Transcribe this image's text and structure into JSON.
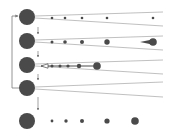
{
  "diagram": {
    "colors": {
      "node": "#4a4a4a",
      "line": "#b0b0b0",
      "arrow": "#7a7a7a",
      "background": "#ffffff"
    },
    "main_nodes": [
      {
        "id": "n1",
        "cx": 27,
        "cy": 17,
        "r": 8
      },
      {
        "id": "n2",
        "cx": 27,
        "cy": 41,
        "r": 8
      },
      {
        "id": "n3",
        "cx": 27,
        "cy": 65,
        "r": 8
      },
      {
        "id": "n4",
        "cx": 27,
        "cy": 88,
        "r": 8
      },
      {
        "id": "n5",
        "cx": 27,
        "cy": 121,
        "r": 8
      }
    ],
    "fans": [
      {
        "from": "n1",
        "x1": 35,
        "top": [
          16,
          12
        ],
        "bottom": [
          18,
          26
        ],
        "x2": 163
      },
      {
        "from": "n2",
        "x1": 35,
        "top": [
          40,
          36
        ],
        "bottom": [
          42,
          50
        ],
        "x2": 163
      },
      {
        "from": "n3",
        "x1": 35,
        "top": [
          64,
          60
        ],
        "bottom": [
          66,
          74
        ],
        "x2": 163
      },
      {
        "from": "n4",
        "x1": 35,
        "top": [
          87,
          82
        ],
        "bottom": [
          89,
          97
        ],
        "x2": 163
      }
    ],
    "rows": [
      {
        "row": 1,
        "cy": 18,
        "dots": [
          {
            "cx": 52,
            "r": 1.3
          },
          {
            "cx": 65,
            "r": 1.3
          },
          {
            "cx": 82,
            "r": 1.3
          },
          {
            "cx": 107,
            "r": 1.3
          },
          {
            "cx": 153,
            "r": 1.3
          }
        ]
      },
      {
        "row": 2,
        "cy": 42,
        "dots": [
          {
            "cx": 52,
            "r": 1.5
          },
          {
            "cx": 65,
            "r": 1.8
          },
          {
            "cx": 82,
            "r": 2
          },
          {
            "cx": 107,
            "r": 2.7
          },
          {
            "cx": 153,
            "r": 3.8
          }
        ],
        "comet": {
          "head_cx": 153,
          "tail_x": 140
        }
      },
      {
        "row": 3,
        "cy": 66,
        "dots": [
          {
            "cx": 52,
            "r": 1.5
          },
          {
            "cx": 60,
            "r": 1.5
          },
          {
            "cx": 68,
            "r": 1.6
          },
          {
            "cx": 79,
            "r": 2.2
          },
          {
            "cx": 97,
            "r": 3.8
          }
        ],
        "arrow": {
          "from_x": 97,
          "to_x": 41
        }
      },
      {
        "row": 5,
        "cy": 121,
        "dots": [
          {
            "cx": 52,
            "r": 1.4
          },
          {
            "cx": 66,
            "r": 1.7
          },
          {
            "cx": 82,
            "r": 2
          },
          {
            "cx": 107,
            "r": 2.6
          },
          {
            "cx": 135,
            "r": 3.8
          }
        ]
      }
    ],
    "down_arrows": [
      {
        "x": 38,
        "y1": 27,
        "y2": 34
      },
      {
        "x": 38,
        "y1": 51,
        "y2": 57
      },
      {
        "x": 38,
        "y1": 74,
        "y2": 80
      },
      {
        "x": 38,
        "y1": 97,
        "y2": 110
      }
    ],
    "feedback_loop": {
      "x": 12,
      "from_y": 88,
      "to_y": 16,
      "into_x": 18
    }
  }
}
